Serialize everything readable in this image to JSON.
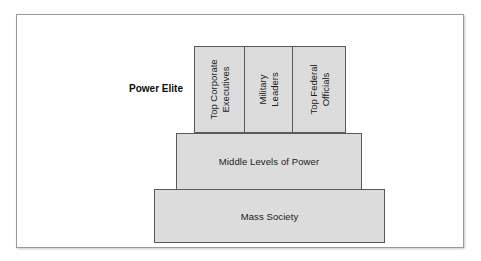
{
  "diagram": {
    "caption": "Power Elite",
    "colors": {
      "tier_fill": "#dcdcdc",
      "tier_border": "#595959",
      "frame_border": "#9a9a9a",
      "text": "#1b1b1b",
      "background": "#ffffff"
    },
    "elite_cells": [
      {
        "line1": "Top Corporate",
        "line2": "Executives"
      },
      {
        "line1": "Military",
        "line2": "Leaders"
      },
      {
        "line1": "Top Federal",
        "line2": "Officials"
      }
    ],
    "tiers": [
      {
        "label": "Middle Levels of Power"
      },
      {
        "label": "Mass Society"
      }
    ]
  }
}
